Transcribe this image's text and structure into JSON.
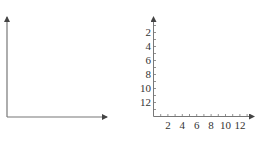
{
  "figures": [
    {
      "id": "blank-axes",
      "description": "Empty first-quadrant axes with arrows, no ticks or labels"
    },
    {
      "id": "inverted-y-axes",
      "y_tick_labels": [
        "2",
        "4",
        "6",
        "8",
        "10",
        "12"
      ],
      "x_tick_labels": [
        "2",
        "4",
        "6",
        "8",
        "10",
        "12"
      ]
    }
  ],
  "colors": {
    "axis": "#555555",
    "text": "#333333",
    "background": "#ffffff"
  }
}
